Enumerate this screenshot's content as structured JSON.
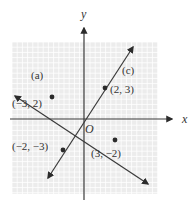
{
  "diagram": {
    "type": "coordinate-plane",
    "axes": {
      "x_label": "x",
      "y_label": "y",
      "origin_label": "O"
    },
    "grid": {
      "xmin": -7,
      "xmax": 7,
      "ymin": -7,
      "ymax": 7,
      "background": "#ececec",
      "grid_color": "#ffffff"
    },
    "lines": [
      {
        "id": "a",
        "label": "(a)",
        "slope": "-2/3",
        "points": [
          [
            -3,
            2
          ],
          [
            3,
            -2
          ]
        ]
      },
      {
        "id": "c",
        "label": "(c)",
        "slope": "3/2",
        "points": [
          [
            2,
            3
          ],
          [
            -2,
            -3
          ]
        ]
      }
    ],
    "points": [
      {
        "x": -3,
        "y": 2,
        "label": "(−3, 2)"
      },
      {
        "x": 2,
        "y": 3,
        "label": "(2, 3)"
      },
      {
        "x": -2,
        "y": -3,
        "label": "(−2, −3)"
      },
      {
        "x": 3,
        "y": -2,
        "label": "(3, −2)"
      }
    ],
    "colors": {
      "line": "#3a3a3a",
      "axis": "#3a3a3a",
      "point": "#2b2b2b"
    }
  }
}
